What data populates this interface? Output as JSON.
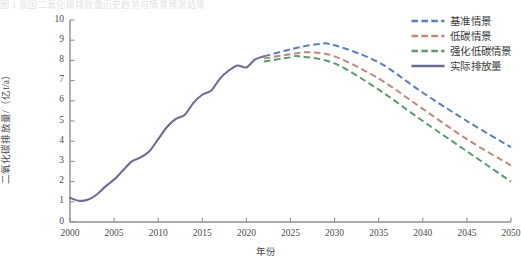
{
  "top_strip_text": "图 1  我国二氧化碳排放量历史趋势与情景预测结果",
  "axes": {
    "ylabel": "二氧化碳排放量/（亿t/a）",
    "xlabel": "年份",
    "yticks": [
      "0",
      "1",
      "2",
      "3",
      "4",
      "5",
      "6",
      "7",
      "8",
      "9",
      "10"
    ],
    "xticks": [
      "2000",
      "2005",
      "2010",
      "2015",
      "2020",
      "2025",
      "2030",
      "2035",
      "2040",
      "2045",
      "2050"
    ]
  },
  "colors": {
    "baseline": "#5b7fb8",
    "low_carbon": "#c08878",
    "enhanced_low_carbon": "#5a9b6e",
    "actual": "#6b6d93",
    "axis": "#8e8e93",
    "text": "#3a3a3a"
  },
  "legend": {
    "position": "top-right",
    "items": [
      {
        "label": "基准情景",
        "color_key": "baseline",
        "style": "dashed"
      },
      {
        "label": "低碳情景",
        "color_key": "low_carbon",
        "style": "dashed"
      },
      {
        "label": "强化低碳情景",
        "color_key": "enhanced_low_carbon",
        "style": "dashed"
      },
      {
        "label": "实际排放量",
        "color_key": "actual",
        "style": "solid"
      }
    ]
  },
  "chart_data": {
    "type": "line",
    "title": "",
    "subtitle": "",
    "xlabel": "年份",
    "ylabel": "二氧化碳排放量/（亿t/a）",
    "xlim": [
      2000,
      2050
    ],
    "ylim": [
      0,
      10
    ],
    "ytick_step": 1,
    "xtick_step": 5,
    "grid": false,
    "legend_position": "top-right",
    "series": [
      {
        "name": "实际排放量",
        "style": "solid",
        "color": "#6b6d93",
        "x": [
          2000,
          2001,
          2002,
          2003,
          2004,
          2005,
          2006,
          2007,
          2008,
          2009,
          2010,
          2011,
          2012,
          2013,
          2014,
          2015,
          2016,
          2017,
          2018,
          2019,
          2020,
          2021,
          2022
        ],
        "values": [
          1.2,
          1.05,
          1.1,
          1.35,
          1.75,
          2.1,
          2.55,
          3.0,
          3.2,
          3.5,
          4.1,
          4.7,
          5.1,
          5.3,
          5.9,
          6.3,
          6.5,
          7.1,
          7.5,
          7.75,
          7.65,
          8.05,
          8.2
        ]
      },
      {
        "name": "基准情景",
        "style": "dashed",
        "color": "#5b7fb8",
        "x": [
          2022,
          2025,
          2028,
          2030,
          2035,
          2040,
          2045,
          2050
        ],
        "values": [
          8.2,
          8.55,
          8.8,
          8.75,
          7.9,
          6.4,
          5.0,
          3.7
        ]
      },
      {
        "name": "低碳情景",
        "style": "dashed",
        "color": "#c08878",
        "x": [
          2022,
          2025,
          2027,
          2030,
          2035,
          2040,
          2045,
          2050
        ],
        "values": [
          8.1,
          8.3,
          8.4,
          8.2,
          7.1,
          5.6,
          4.1,
          2.8
        ]
      },
      {
        "name": "强化低碳情景",
        "style": "dashed",
        "color": "#5a9b6e",
        "x": [
          2022,
          2025,
          2026,
          2030,
          2035,
          2040,
          2045,
          2050
        ],
        "values": [
          7.95,
          8.15,
          8.2,
          7.85,
          6.55,
          5.0,
          3.5,
          2.0
        ]
      }
    ],
    "annotations": []
  }
}
